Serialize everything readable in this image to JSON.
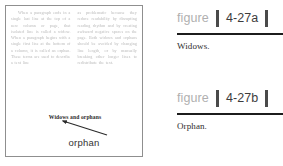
{
  "specimen": {
    "columns": [
      "When a paragraph ends in a single last line at the top of a new column or page, that isolated line is called a widow. When a paragraph begins with a single first line at the bottom of a column, it is called an orphan. These terms are used to describe a text line",
      "as problematic because they reduce readability by disrupting reading rhythm and by creating awkward negative spaces on the page. Both widows and orphans should be avoided by changing line length, or by manually breaking other longer lines to redistribute the text."
    ],
    "callout_line": "Widows and orphans",
    "arrow_label": "orphan",
    "arrow": {
      "name": "annotation-arrow",
      "x1": 101,
      "y1": 129,
      "x2": 55,
      "y2": 114
    }
  },
  "figures": [
    {
      "label_word": "figure",
      "number": "4-27a",
      "caption": "Widows."
    },
    {
      "label_word": "figure",
      "number": "4-27b",
      "caption": "Orphan."
    }
  ],
  "colors": {
    "figure_word": "#b0b0b0",
    "figure_number": "#3d3d3d",
    "bar": "#4a4a4a",
    "rule": "#1c1c1c",
    "panel_border": "#8f8f8f",
    "body_copy": "#b9b9b9"
  }
}
